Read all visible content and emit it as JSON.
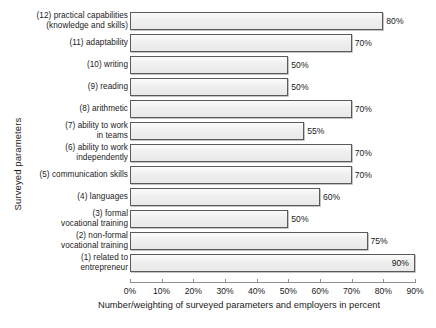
{
  "chart_data": {
    "type": "bar",
    "orientation": "horizontal",
    "title": "",
    "xlabel": "Number/weighting of surveyed parameters and employers in percent",
    "ylabel": "Surveyed parameters",
    "xlim": [
      0,
      90
    ],
    "xticks": [
      "0%",
      "10%",
      "20%",
      "30%",
      "40%",
      "50%",
      "60%",
      "70%",
      "80%",
      "90%"
    ],
    "xtick_values": [
      0,
      10,
      20,
      30,
      40,
      50,
      60,
      70,
      80,
      90
    ],
    "grid": false,
    "legend": null,
    "value_label_suffix": "%",
    "categories": [
      "(12) practical capabilities\n(knowledge and skills)",
      "(11) adaptability",
      "(10) writing",
      "(9) reading",
      "(8) arithmetic",
      "(7) ability to work\nin teams",
      "(6) ability to work\nindependently",
      "(5) communication skills",
      "(4) languages",
      "(3) formal\nvocational training",
      "(2) non-formal\nvocational training",
      "(1) related to\nentrepreneur"
    ],
    "values": [
      80,
      70,
      50,
      50,
      70,
      55,
      70,
      70,
      60,
      50,
      75,
      90
    ],
    "value_labels": [
      "80%",
      "70%",
      "50%",
      "50%",
      "70%",
      "55%",
      "70%",
      "70%",
      "60%",
      "50%",
      "75%",
      "90%"
    ],
    "bars": [
      {
        "category": "(12) practical capabilities\n(knowledge and skills)",
        "value": 80,
        "label": "80%",
        "label_position": "outside"
      },
      {
        "category": "(11) adaptability",
        "value": 70,
        "label": "70%",
        "label_position": "outside"
      },
      {
        "category": "(10) writing",
        "value": 50,
        "label": "50%",
        "label_position": "outside"
      },
      {
        "category": "(9) reading",
        "value": 50,
        "label": "50%",
        "label_position": "outside"
      },
      {
        "category": "(8) arithmetic",
        "value": 70,
        "label": "70%",
        "label_position": "outside"
      },
      {
        "category": "(7) ability to work\nin teams",
        "value": 55,
        "label": "55%",
        "label_position": "outside"
      },
      {
        "category": "(6) ability to work\nindependently",
        "value": 70,
        "label": "70%",
        "label_position": "outside"
      },
      {
        "category": "(5) communication skills",
        "value": 70,
        "label": "70%",
        "label_position": "outside"
      },
      {
        "category": "(4) languages",
        "value": 60,
        "label": "60%",
        "label_position": "outside"
      },
      {
        "category": "(3) formal\nvocational training",
        "value": 50,
        "label": "50%",
        "label_position": "outside"
      },
      {
        "category": "(2) non-formal\nvocational training",
        "value": 75,
        "label": "75%",
        "label_position": "outside"
      },
      {
        "category": "(1) related to\nentrepreneur",
        "value": 90,
        "label": "90%",
        "label_position": "inside"
      }
    ],
    "colors": {
      "bar_fill": "#eeeeee",
      "bar_border": "#5a5a5a",
      "axis": "#8e8e8e",
      "text": "#1a1a1a",
      "background": "#ffffff"
    }
  }
}
